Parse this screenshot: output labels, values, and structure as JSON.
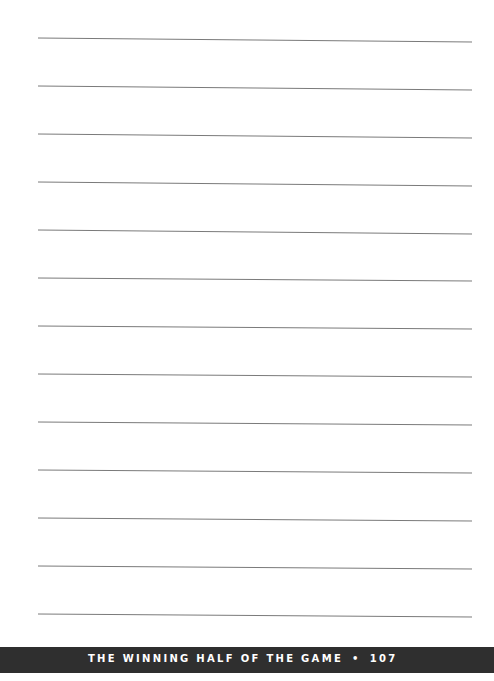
{
  "page": {
    "type": "lined-notes-page",
    "line_count": 13,
    "line_color": "#777777"
  },
  "footer": {
    "title": "THE WINNING HALF OF THE GAME",
    "separator": "•",
    "page_number": "107",
    "background": "#2f2f2f",
    "text_color": "#ffffff"
  }
}
